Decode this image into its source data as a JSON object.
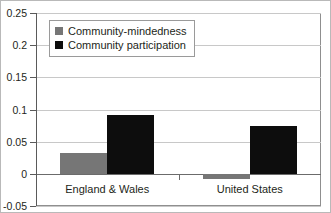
{
  "chart_data": {
    "type": "bar",
    "title": "",
    "xlabel": "",
    "ylabel": "",
    "categories": [
      "England & Wales",
      "United States"
    ],
    "series": [
      {
        "name": "Community-mindedness",
        "color": "#767676",
        "values": [
          0.033,
          -0.008
        ]
      },
      {
        "name": "Community participation",
        "color": "#0d0d0d",
        "values": [
          0.092,
          0.074
        ]
      }
    ],
    "ylim": [
      -0.05,
      0.25
    ],
    "ytick_values": [
      0.25,
      0.2,
      0.15,
      0.1,
      0.05,
      0,
      -0.05
    ],
    "ytick_labels": [
      "0.25",
      "0.2",
      "0.15",
      "0.1",
      "0.05",
      "0",
      "-0.05"
    ],
    "grid": true,
    "grid_axis": "y",
    "legend": {
      "position": "top-left",
      "entries": [
        "Community-mindedness",
        "Community participation"
      ]
    },
    "zero_line": 0,
    "background_color": "#ffffff",
    "plot_border_color": "#8f8f8f"
  }
}
